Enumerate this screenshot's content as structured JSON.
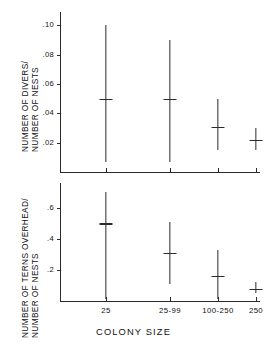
{
  "figure": {
    "xaxis_title": "COLONY SIZE",
    "upper_ylabel_line1": "NUMBER OF DIVERS/",
    "upper_ylabel_line2": "NUMBER OF NESTS",
    "lower_ylabel_line1": "NUMBER OF TERNS OVERHEAD/",
    "lower_ylabel_line2": "NUMBER OF NESTS",
    "line_color": "#2b2b2b",
    "background": "#ffffff"
  },
  "chart_data": [
    {
      "type": "scatter",
      "title": "",
      "panel": "upper",
      "ylabel": "NUMBER OF DIVERS/ NUMBER OF NESTS",
      "xlabel": "COLONY SIZE",
      "categories": [
        "25",
        "25-99",
        "100-250",
        "250"
      ],
      "ylim": [
        0,
        0.105
      ],
      "yticks": [
        0.02,
        0.04,
        0.06,
        0.08,
        0.1
      ],
      "ytick_labels": [
        ".02",
        ".04",
        ".06",
        ".08",
        ".10"
      ],
      "grid": false,
      "legend": "none",
      "series": [
        {
          "name": "median",
          "values": [
            0.05,
            0.05,
            0.031,
            0.022
          ]
        },
        {
          "name": "range_low",
          "values": [
            0.007,
            0.007,
            0.015,
            0.015
          ]
        },
        {
          "name": "range_high",
          "values": [
            0.1,
            0.09,
            0.05,
            0.03
          ]
        }
      ]
    },
    {
      "type": "scatter",
      "title": "",
      "panel": "lower",
      "ylabel": "NUMBER OF TERNS OVERHEAD/ NUMBER OF NESTS",
      "xlabel": "COLONY SIZE",
      "categories": [
        "25",
        "25-99",
        "100-250",
        "250"
      ],
      "ylim": [
        0,
        0.72
      ],
      "yticks": [
        0.2,
        0.4,
        0.6
      ],
      "ytick_labels": [
        ".2",
        ".4",
        ".6"
      ],
      "grid": false,
      "legend": "none",
      "series": [
        {
          "name": "median",
          "values": [
            0.5,
            0.31,
            0.16,
            0.08
          ]
        },
        {
          "name": "range_low",
          "values": [
            0.01,
            0.11,
            0.01,
            0.05
          ]
        },
        {
          "name": "range_high",
          "values": [
            0.7,
            0.51,
            0.33,
            0.12
          ]
        }
      ]
    }
  ]
}
